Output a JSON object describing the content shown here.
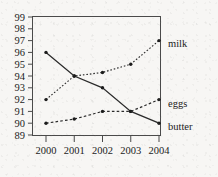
{
  "chart_data": {
    "type": "line",
    "title": "",
    "xlabel": "",
    "ylabel": "",
    "categories": [
      "2000",
      "2001",
      "2002",
      "2003",
      "2004"
    ],
    "x": [
      2000,
      2001,
      2002,
      2003,
      2004
    ],
    "xlim": [
      2000,
      2004
    ],
    "ylim": [
      89,
      99
    ],
    "yticks": [
      89,
      90,
      91,
      92,
      93,
      94,
      95,
      96,
      97,
      98,
      99
    ],
    "ytick_labels": [
      "89",
      "90",
      "91",
      "92",
      "93",
      "94",
      "95",
      "96",
      "97",
      "98",
      "99"
    ],
    "xtick_labels": [
      "2000",
      "2001",
      "2002",
      "2003",
      "2004"
    ],
    "grid": false,
    "legend_position": "right-inline-labels",
    "series": [
      {
        "name": "milk",
        "label": "milk",
        "linestyle": "dotted",
        "color": "#2a2a2a",
        "values": [
          92,
          94,
          94.3,
          95,
          97
        ]
      },
      {
        "name": "butter",
        "label": "butter",
        "linestyle": "solid",
        "color": "#2a2a2a",
        "values": [
          96,
          94,
          93,
          91,
          90
        ]
      },
      {
        "name": "eggs",
        "label": "eggs",
        "linestyle": "dashed",
        "color": "#2a2a2a",
        "values": [
          90,
          90.35,
          91,
          91,
          92
        ]
      }
    ]
  },
  "labels": {
    "milk": "milk",
    "eggs": "eggs",
    "butter": "butter",
    "y_89": "89",
    "y_90": "90",
    "y_91": "91",
    "y_92": "92",
    "y_93": "93",
    "y_94": "94",
    "y_95": "95",
    "y_96": "96",
    "y_97": "97",
    "y_98": "98",
    "y_99": "99",
    "x_2000": "2000",
    "x_2001": "2001",
    "x_2002": "2002",
    "x_2003": "2003",
    "x_2004": "2004"
  }
}
